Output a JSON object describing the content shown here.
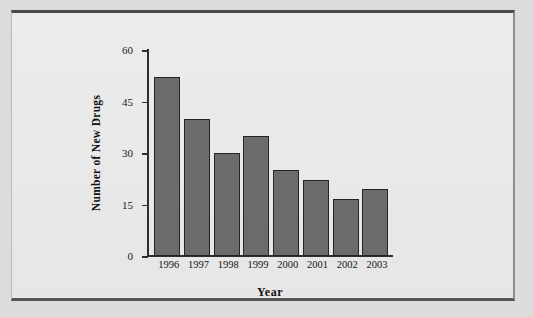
{
  "chart_data": {
    "type": "bar",
    "title": "",
    "xlabel": "Year",
    "ylabel": "Number of New Drugs",
    "categories": [
      "1996",
      "1997",
      "1998",
      "1999",
      "2000",
      "2001",
      "2002",
      "2003"
    ],
    "values": [
      52,
      40,
      30,
      35,
      25,
      22,
      16.5,
      19.5
    ],
    "ylim": [
      0,
      60
    ],
    "yticks": [
      0,
      15,
      30,
      45,
      60
    ],
    "ytick_labels": [
      "0",
      "15",
      "30",
      "45",
      "60"
    ],
    "grid": false,
    "legend": null,
    "bar_color": "#6b6b6b",
    "bar_edge_color": "#242424",
    "background_color": "#e9e9e9"
  }
}
